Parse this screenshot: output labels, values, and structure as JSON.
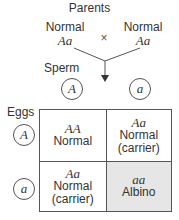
{
  "title": "Parents",
  "parents": [
    {
      "phenotype": "Normal",
      "genotype": "Aa"
    },
    {
      "phenotype": "Normal",
      "genotype": "Aa"
    }
  ],
  "cross_symbol": "×",
  "sperm_label": "Sperm",
  "eggs_label": "Eggs",
  "sperm_alleles": [
    "A",
    "a"
  ],
  "egg_alleles": [
    "A",
    "a"
  ],
  "cells": [
    {
      "genotype": "AA",
      "phenotype": "Normal",
      "note": ""
    },
    {
      "genotype": "Aa",
      "phenotype": "Normal",
      "note": "(carrier)"
    },
    {
      "genotype": "Aa",
      "phenotype": "Normal",
      "note": "(carrier)"
    },
    {
      "genotype": "aa",
      "phenotype": "Albino",
      "note": ""
    }
  ],
  "colors": {
    "shaded_cell": "#e6e6e6",
    "lines": "#555555"
  }
}
